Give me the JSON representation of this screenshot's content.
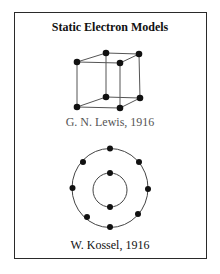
{
  "title": "Static Electron Models",
  "models": [
    {
      "label": "G. N. Lewis, 1916",
      "type": "cubic-atom",
      "electron_count": 8
    },
    {
      "label": "W. Kossel, 1916",
      "type": "concentric-shells",
      "shells": [
        {
          "electrons": 2
        },
        {
          "electrons": 8
        }
      ]
    }
  ],
  "colors": {
    "line": "#444444",
    "electron": "#111111",
    "border": "#2a2a2a"
  }
}
